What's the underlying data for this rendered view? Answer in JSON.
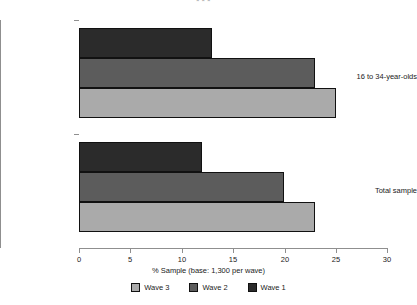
{
  "chart_data": {
    "type": "bar",
    "orientation": "horizontal",
    "title": "",
    "annotation": "***",
    "xlabel": "% Sample (base: 1,300 per wave)",
    "ylabel": "",
    "categories": [
      "16 to 34-year-olds",
      "Total sample"
    ],
    "series": [
      {
        "name": "Wave 1",
        "color": "#2b2b2b",
        "values": [
          13,
          12
        ]
      },
      {
        "name": "Wave 2",
        "color": "#5c5c5c",
        "values": [
          23,
          20
        ]
      },
      {
        "name": "Wave 3",
        "color": "#aaaaaa",
        "values": [
          25,
          23
        ]
      }
    ],
    "xlim": [
      0,
      30
    ],
    "xticks": [
      0,
      5,
      10,
      15,
      20,
      25,
      30
    ],
    "xtick_labels": [
      "0",
      "5",
      "10",
      "15",
      "20",
      "25",
      "30"
    ],
    "grid": false,
    "legend_position": "bottom",
    "legend_order": [
      "Wave 3",
      "Wave 2",
      "Wave 1"
    ]
  },
  "axis": {
    "x_title": "% Sample (base: 1,300 per wave)"
  },
  "legend": {
    "items": [
      {
        "label": "Wave 3",
        "color": "#aaaaaa"
      },
      {
        "label": "Wave 2",
        "color": "#5c5c5c"
      },
      {
        "label": "Wave 1",
        "color": "#2b2b2b"
      }
    ]
  },
  "marker": {
    "significance": "***"
  }
}
